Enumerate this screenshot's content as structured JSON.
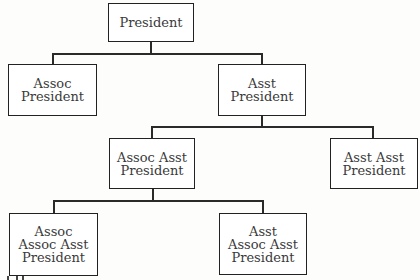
{
  "diagram": {
    "type": "org-chart",
    "nodes": [
      {
        "id": "president",
        "lines": [
          "President"
        ]
      },
      {
        "id": "assoc-president",
        "lines": [
          "Assoc",
          "President"
        ]
      },
      {
        "id": "asst-president",
        "lines": [
          "Asst",
          "President"
        ]
      },
      {
        "id": "assoc-asst-president",
        "lines": [
          "Assoc Asst",
          "President"
        ]
      },
      {
        "id": "asst-asst-president",
        "lines": [
          "Asst Asst",
          "President"
        ]
      },
      {
        "id": "assoc-assoc-asst-president",
        "lines": [
          "Assoc",
          "Assoc Asst",
          "President"
        ]
      },
      {
        "id": "asst-assoc-asst-president",
        "lines": [
          "Asst",
          "Assoc Asst",
          "President"
        ]
      }
    ],
    "edges": [
      {
        "from": "president",
        "to": "assoc-president"
      },
      {
        "from": "president",
        "to": "asst-president"
      },
      {
        "from": "asst-president",
        "to": "assoc-asst-president"
      },
      {
        "from": "asst-president",
        "to": "asst-asst-president"
      },
      {
        "from": "assoc-asst-president",
        "to": "assoc-assoc-asst-president"
      },
      {
        "from": "assoc-asst-president",
        "to": "asst-assoc-asst-president"
      }
    ],
    "colors": {
      "line": "#2a2a2a",
      "border": "#222222",
      "text": "#3a3a3a",
      "background": "#ffffff"
    }
  }
}
